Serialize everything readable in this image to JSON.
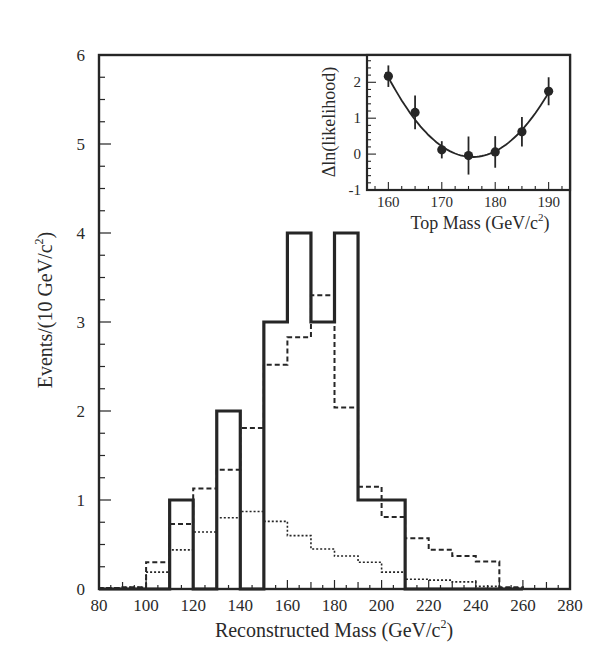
{
  "chart_data": {
    "type": "bar",
    "subtype": "histogram",
    "title": "",
    "xlabel": "Reconstructed Mass (GeV/c²)",
    "ylabel": "Events/(10 GeV/c²)",
    "xlim": [
      80,
      280
    ],
    "ylim": [
      0,
      6
    ],
    "xticks": [
      80,
      100,
      120,
      140,
      160,
      180,
      200,
      220,
      240,
      260,
      280
    ],
    "yticks": [
      0,
      1,
      2,
      3,
      4,
      5,
      6
    ],
    "grid": false,
    "legend": null,
    "bin_edges": [
      80,
      90,
      100,
      110,
      120,
      130,
      140,
      150,
      160,
      170,
      180,
      190,
      200,
      210,
      220,
      230,
      240,
      250,
      260
    ],
    "series": [
      {
        "name": "Data",
        "style": "solid",
        "values": [
          0,
          0,
          0,
          1,
          0,
          2,
          0,
          3,
          4,
          3,
          4,
          1,
          1,
          0,
          0,
          0,
          0,
          0
        ]
      },
      {
        "name": "Signal + background",
        "style": "dashed",
        "values": [
          0.01,
          0.02,
          0.3,
          0.73,
          1.13,
          1.34,
          1.81,
          2.52,
          2.83,
          3.3,
          2.04,
          1.15,
          0.81,
          0.57,
          0.44,
          0.37,
          0.31,
          0.02
        ]
      },
      {
        "name": "Background",
        "style": "dotted",
        "values": [
          0.01,
          0.02,
          0.19,
          0.44,
          0.64,
          0.8,
          0.87,
          0.76,
          0.6,
          0.45,
          0.37,
          0.3,
          0.19,
          0.11,
          0.1,
          0.08,
          0.03,
          0.01
        ]
      }
    ],
    "inset": {
      "type": "scatter",
      "xlabel": "Top Mass (GeV/c²)",
      "ylabel": "Δln(likelihood)",
      "xlim": [
        156,
        194
      ],
      "ylim": [
        -1,
        2.76
      ],
      "xticks": [
        160,
        170,
        180,
        190
      ],
      "yticks": [
        -1,
        0,
        1,
        2
      ],
      "points": [
        {
          "x": 160,
          "y": 2.17,
          "err": 0.3
        },
        {
          "x": 165,
          "y": 1.16,
          "err": 0.47
        },
        {
          "x": 170,
          "y": 0.12,
          "err": 0.24
        },
        {
          "x": 175,
          "y": -0.04,
          "err": 0.53
        },
        {
          "x": 180,
          "y": 0.06,
          "err": 0.44
        },
        {
          "x": 185,
          "y": 0.62,
          "err": 0.41
        },
        {
          "x": 190,
          "y": 1.75,
          "err": 0.39
        }
      ],
      "fit": {
        "type": "parabola",
        "x_min": 175.8,
        "y_min": -0.08,
        "curvature": 0.0089
      }
    }
  },
  "labels": {
    "xlabel_main": "Reconstructed Mass (GeV/c",
    "xlabel_sup": "2",
    "xlabel_close": ")",
    "ylabel_main": "Events/(10 GeV/c",
    "ylabel_sup": "2",
    "ylabel_close": ")",
    "inset_xlabel_main": "Top Mass (GeV/c",
    "inset_xlabel_sup": "2",
    "inset_xlabel_close": ")",
    "inset_ylabel": "Δln(likelihood)"
  },
  "colors": {
    "ink": "#262626",
    "background": "#ffffff"
  }
}
